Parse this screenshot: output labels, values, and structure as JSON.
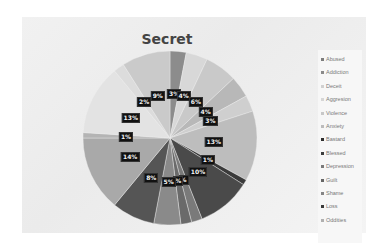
{
  "chart_data": {
    "type": "pie",
    "title": "Secret",
    "legend_position": "right",
    "categories": [
      "Abused",
      "Addiction",
      "Deceit",
      "Aggresion",
      "Violence",
      "Anxiety",
      "Bastard",
      "Blessed",
      "Depression",
      "Guilt",
      "Shame",
      "Loss",
      "Oddities",
      "(unlabeled 14)",
      "(unlabeled 15)",
      "(unlabeled 16)",
      "(unlabeled 17)"
    ],
    "values": [
      3,
      4,
      6,
      4,
      3,
      13,
      1,
      10,
      2,
      2,
      5,
      8,
      14,
      1,
      13,
      2,
      9
    ],
    "data_labels": [
      "3%",
      "4%",
      "6%",
      "4%",
      "3%",
      "13%",
      "1%",
      "10%",
      "%",
      "%",
      "5%",
      "8%",
      "14%",
      "1%",
      "13%",
      "2%",
      "9%"
    ],
    "colors": [
      "#8c8c8c",
      "#d8d8d8",
      "#c9c9c9",
      "#b8b8b8",
      "#cfcfcf",
      "#bdbdbd",
      "#3a3a3a",
      "#4a4a4a",
      "#7a7a7a",
      "#6a6a6a",
      "#8a8a8a",
      "#555555",
      "#a9a9a9",
      "#b4b4b4",
      "#e3e3e3",
      "#dcdcdc",
      "#cacaca"
    ]
  },
  "title": "Secret",
  "legend": [
    {
      "label": "Abused",
      "color": "#7d7d7d"
    },
    {
      "label": "Addiction",
      "color": "#8a8a8a"
    },
    {
      "label": "Deceit",
      "color": "#d0d0d0"
    },
    {
      "label": "Aggresion",
      "color": "#d6d6d6"
    },
    {
      "label": "Violence",
      "color": "#c8c8c8"
    },
    {
      "label": "Anxiety",
      "color": "#bcbcbc"
    },
    {
      "label": "Bastard",
      "color": "#2e2e2e"
    },
    {
      "label": "Blessed",
      "color": "#3c3c3c"
    },
    {
      "label": "Depression",
      "color": "#7a7a7a"
    },
    {
      "label": "Guilt",
      "color": "#666666"
    },
    {
      "label": "Shame",
      "color": "#858585"
    },
    {
      "label": "Loss",
      "color": "#3a3a3a"
    },
    {
      "label": "Oddities",
      "color": "#b0b0b0"
    }
  ]
}
